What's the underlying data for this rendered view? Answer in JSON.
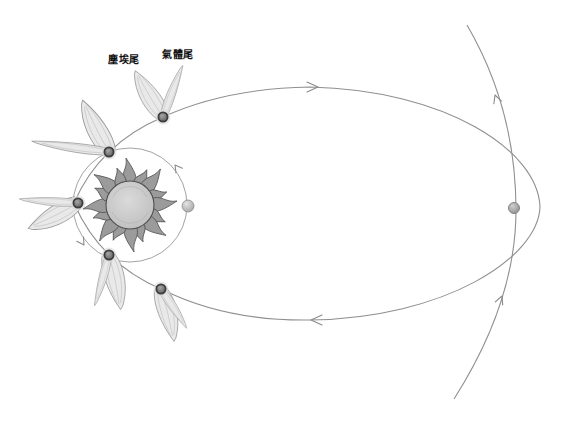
{
  "figure": {
    "labels": {
      "dust_tail": "塵埃尾",
      "gas_tail": "氣體尾"
    }
  },
  "colors": {
    "background": "#ffffff",
    "orbit_line": "#8f8f8f",
    "planet_orbit_line": "#979797",
    "outer_path_line": "#8f8f8f",
    "sun_core": "#cccccc",
    "sun_ray": "#9b9b9b",
    "sun_outline": "#4f4f4f",
    "comet_nucleus": "#6b6b6b",
    "comet_nucleus_ring": "#3d3d3d",
    "tail_fill": "#e9e9e9",
    "tail_outline": "#9a9a9a",
    "planet_fill": "#c4c4c4",
    "distant_comet_fill": "#b3b3b3",
    "label_text": "#111111"
  }
}
